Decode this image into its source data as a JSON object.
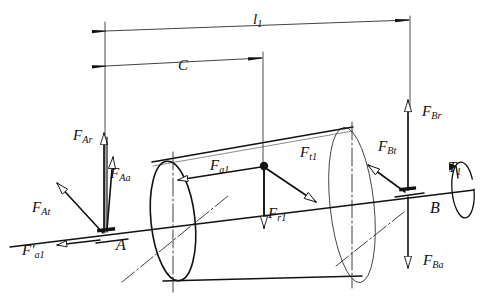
{
  "diagram": {
    "background_color": "#ffffff",
    "line_color": "#111111",
    "dimensions": [
      {
        "id": "l1",
        "base": "l",
        "sub": "1",
        "label": "l1",
        "x": 253,
        "y": 12
      },
      {
        "id": "C",
        "base": "C",
        "sub": "",
        "label": "C",
        "x": 178,
        "y": 58
      }
    ],
    "points": [
      {
        "id": "A",
        "label": "A",
        "x": 116,
        "y": 237
      },
      {
        "id": "B",
        "label": "B",
        "x": 430,
        "y": 200
      }
    ],
    "forces": [
      {
        "id": "F_Ar",
        "base": "F",
        "sub": "Ar",
        "label": "F Ar",
        "x": 73,
        "y": 128,
        "dir": "up"
      },
      {
        "id": "F_Aa",
        "base": "F",
        "sub": "Aa",
        "label": "F Aa",
        "x": 110,
        "y": 166,
        "dir": "up-right"
      },
      {
        "id": "F_At",
        "base": "F",
        "sub": "At",
        "label": "F At",
        "x": 32,
        "y": 200,
        "dir": "up-left"
      },
      {
        "id": "F_a1p",
        "base": "F'",
        "sub": "a1",
        "label": "F'a1",
        "x": 22,
        "y": 243,
        "dir": "left"
      },
      {
        "id": "F_a1",
        "base": "F",
        "sub": "a1",
        "label": "F a1",
        "x": 210,
        "y": 158,
        "dir": "left"
      },
      {
        "id": "F_r1",
        "base": "F",
        "sub": "r1",
        "label": "F r1",
        "x": 268,
        "y": 206,
        "dir": "down"
      },
      {
        "id": "F_t1",
        "base": "F",
        "sub": "t1",
        "label": "F t1",
        "x": 300,
        "y": 145,
        "dir": "down-right"
      },
      {
        "id": "F_Bt",
        "base": "F",
        "sub": "Bt",
        "label": "F Bt",
        "x": 378,
        "y": 139,
        "dir": "up-left"
      },
      {
        "id": "F_Br",
        "base": "F",
        "sub": "Br",
        "label": "F Br",
        "x": 422,
        "y": 104,
        "dir": "up"
      },
      {
        "id": "F_Ba",
        "base": "F",
        "sub": "Ba",
        "label": "F Ba",
        "x": 423,
        "y": 253,
        "dir": "down"
      }
    ],
    "torques": [
      {
        "id": "T1",
        "base": "T",
        "sub": "1",
        "label": "T1",
        "x": 448,
        "y": 160,
        "dir": "cw-about-axis"
      }
    ]
  }
}
